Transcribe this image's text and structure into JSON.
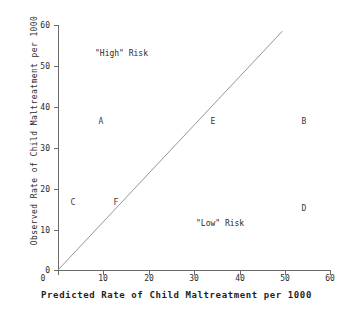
{
  "chart_data": {
    "type": "scatter",
    "title": "",
    "xlabel": "Predicted Rate of Child Maltreatment per 1000",
    "ylabel": "Observed Rate of Child Maltreatment per 1000",
    "xlim": [
      0,
      60
    ],
    "ylim": [
      0,
      60
    ],
    "xticks": [
      "0",
      "10",
      "20",
      "30",
      "40",
      "50",
      "60"
    ],
    "yticks": [
      "0",
      "10",
      "20",
      "30",
      "40",
      "50",
      "60"
    ],
    "xtick_values": [
      0,
      10,
      20,
      30,
      40,
      50,
      60
    ],
    "ytick_values": [
      0,
      10,
      20,
      30,
      40,
      50,
      60
    ],
    "grid": false,
    "legend": "none",
    "points": [
      {
        "label": "A",
        "x": 9.3,
        "y": 36.3
      },
      {
        "label": "B",
        "x": 54.0,
        "y": 36.3
      },
      {
        "label": "C",
        "x": 3.1,
        "y": 16.4
      },
      {
        "label": "D",
        "x": 54.0,
        "y": 15.0
      },
      {
        "label": "E",
        "x": 34.0,
        "y": 36.3
      },
      {
        "label": "F",
        "x": 12.6,
        "y": 16.4
      }
    ],
    "reference_line": {
      "name": "identity-line",
      "from": [
        0,
        0
      ],
      "to": [
        49.5,
        58.5
      ],
      "description": "diagonal line where observed equals predicted"
    },
    "annotations": [
      {
        "name": "high-risk-label",
        "text": "\"High\" Risk",
        "x": 12.0,
        "y": 52.0
      },
      {
        "name": "low-risk-label",
        "text": "\"Low\" Risk",
        "x": 32.0,
        "y": 10.5
      }
    ]
  }
}
